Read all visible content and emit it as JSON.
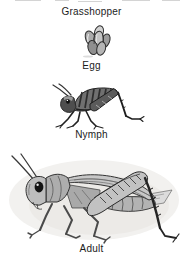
{
  "diagram": {
    "title": "Grasshopper",
    "stages": [
      {
        "label": "Egg",
        "illustration": "egg-cluster-illustration"
      },
      {
        "label": "Nymph",
        "illustration": "nymph-illustration"
      },
      {
        "label": "Adult",
        "illustration": "adult-illustration"
      }
    ],
    "style": {
      "background": "#ffffff",
      "text_color": "#1b1b1b",
      "sketch_outline": "#2b2b2b",
      "sketch_midtone": "#9a9a9a",
      "sketch_light": "#d6d6d6",
      "wash_background": "#f0efec"
    }
  }
}
